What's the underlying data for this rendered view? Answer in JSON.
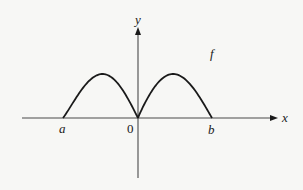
{
  "diagram": {
    "type": "function-graph",
    "function_label": "f",
    "x_axis_label": "x",
    "y_axis_label": "y",
    "origin_label": "0",
    "points": [
      {
        "name": "a",
        "label": "a",
        "x": -1,
        "role": "left zero of f"
      },
      {
        "name": "origin",
        "label": "0",
        "x": 0,
        "role": "zero of f (cusp)"
      },
      {
        "name": "b",
        "label": "b",
        "x": 1,
        "role": "right zero of f"
      }
    ],
    "colors": {
      "ink": "#1a1a1a",
      "axis": "#4a4a4a",
      "background": "#f7f7f5"
    }
  }
}
